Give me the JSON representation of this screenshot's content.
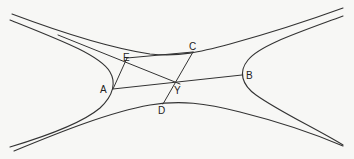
{
  "figure": {
    "type": "geometric diagram of conjugate hyperbolas with chords",
    "points": [
      {
        "id": "A",
        "label": "A",
        "x": 113,
        "y": 89,
        "lx": 100,
        "ly": 93
      },
      {
        "id": "B",
        "label": "B",
        "x": 242,
        "y": 75,
        "lx": 246,
        "ly": 79
      },
      {
        "id": "C",
        "label": "C",
        "x": 193,
        "y": 52,
        "lx": 189,
        "ly": 50
      },
      {
        "id": "D",
        "label": "D",
        "x": 163,
        "y": 104,
        "lx": 158,
        "ly": 114
      },
      {
        "id": "E",
        "label": "E",
        "x": 127,
        "y": 58,
        "lx": 123,
        "ly": 61
      },
      {
        "id": "Y",
        "label": "Y",
        "x": 180,
        "y": 84,
        "lx": 173,
        "ly": 94
      }
    ],
    "segments": [
      {
        "from": "A",
        "to": "E"
      },
      {
        "from": "E",
        "to": "C"
      },
      {
        "from": "A",
        "to": "B"
      },
      {
        "from": "C",
        "to": "D"
      },
      {
        "from": "E",
        "to": "Y"
      }
    ],
    "curves": [
      "left-hyperbola-branch",
      "right-hyperbola-branch",
      "upper-conjugate-branch",
      "lower-conjugate-branch",
      "asymptote-like-line"
    ]
  }
}
